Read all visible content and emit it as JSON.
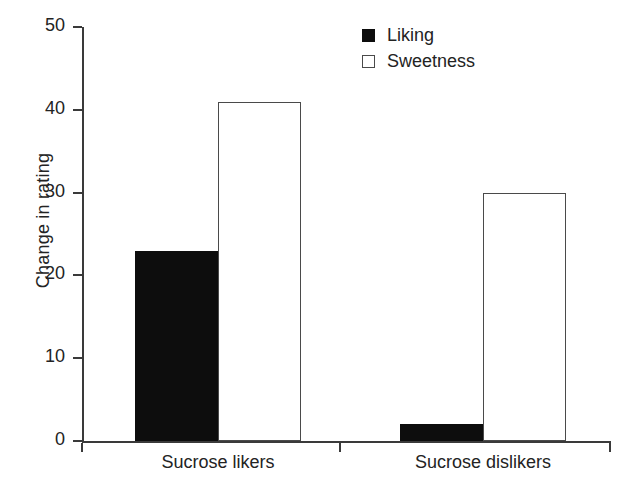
{
  "chart_data": {
    "type": "bar",
    "title": "",
    "subtitle": "",
    "xlabel": "",
    "ylabel": "Change in rating",
    "categories": [
      "Sucrose likers",
      "Sucrose dislikers"
    ],
    "series": [
      {
        "name": "Liking",
        "values": [
          23,
          2
        ],
        "swatch": "filled",
        "color": "#0d0d0d"
      },
      {
        "name": "Sweetness",
        "values": [
          41,
          30
        ],
        "swatch": "open",
        "color": "#ffffff"
      }
    ],
    "ylim": [
      0,
      50
    ],
    "yticks": [
      0,
      10,
      20,
      30,
      40,
      50
    ],
    "ytick_labels": [
      "0",
      "10",
      "20",
      "30",
      "40",
      "50"
    ],
    "grid": false,
    "legend_position": "top-right",
    "bars_touch_within_group": true,
    "axis_color": "#3a3a3a"
  }
}
